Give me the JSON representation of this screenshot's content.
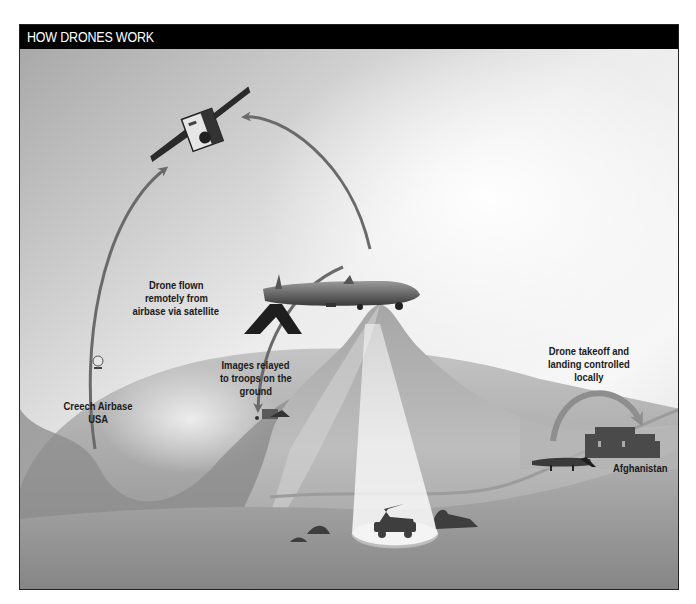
{
  "header": {
    "title": "HOW DRONES WORK"
  },
  "labels": {
    "satellite_link": [
      "Drone flown",
      "remotely from",
      "airbase via satellite"
    ],
    "airbase": [
      "Creech Airbase",
      "USA"
    ],
    "images_relayed": [
      "Images relayed",
      "to troops on the",
      "ground"
    ],
    "local_control": [
      "Drone takeoff and",
      "landing controlled",
      "locally"
    ],
    "country": [
      "Afghanistan"
    ]
  },
  "icons": [
    "satellite-icon",
    "drone-icon",
    "ground-station-icon",
    "troop-vehicle-icon",
    "building-icon",
    "landed-drone-icon",
    "curved-arrow-icon",
    "camera-beam"
  ],
  "colors": {
    "header_bg": "#000000",
    "header_text": "#ffffff",
    "arrow": "#6a6a6a",
    "terrain_dark": "#7a7a7a",
    "terrain_light": "#c9c9c9",
    "sky_light": "#f4f4f4"
  }
}
